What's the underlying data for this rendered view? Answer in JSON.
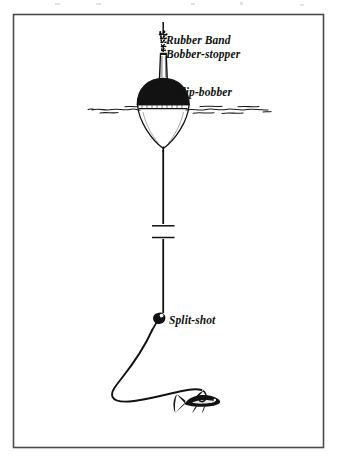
{
  "figure": {
    "medium": "pen-and-ink line illustration",
    "background_color": "#ffffff",
    "ink_color": "#121212",
    "frame": {
      "name": "illustration-border",
      "stroke_color": "#4a4a4a",
      "x": 13,
      "y": 14,
      "width": 310,
      "height": 433
    },
    "labels": [
      {
        "id": "rubber-band",
        "text": "Rubber Band",
        "x": 166,
        "y": 44,
        "font_size": 11.5,
        "style": "italic-bold-serif"
      },
      {
        "id": "bobber-stopper",
        "text": "Bobber-stopper",
        "x": 166,
        "y": 57.5,
        "font_size": 11.5,
        "style": "italic-bold-serif"
      },
      {
        "id": "slip-bobber",
        "text": "Slip-bobber",
        "x": 176,
        "y": 96,
        "font_size": 11.5,
        "style": "italic-bold-serif"
      },
      {
        "id": "split-shot",
        "text": "Split-shot",
        "x": 169,
        "y": 324,
        "font_size": 11.5,
        "style": "italic-bold-serif"
      }
    ],
    "components": [
      {
        "id": "fishing-line-upper",
        "name": "fishing-line",
        "description": "vertical monofilament line running from top of frame down through the rig"
      },
      {
        "id": "rubber-band-knot",
        "name": "rubber-band-knot",
        "description": "small knotted rubber band tied on the line as a depth stop"
      },
      {
        "id": "bobber-stopper-bead",
        "name": "bobber-stopper-bead",
        "description": "tapered stopper tube / bead threaded on the line below the rubber band"
      },
      {
        "id": "slip-bobber-float",
        "name": "slip-bobber-float",
        "description": "float with black domed top above waterline and white tapered body below"
      },
      {
        "id": "waterline",
        "name": "waterline",
        "description": "wavy horizontal water surface line crossing the float"
      },
      {
        "id": "line-break-mark",
        "name": "line-break-mark",
        "description": "two short horizontal tick marks indicating the line continues"
      },
      {
        "id": "split-shot-weight",
        "name": "split-shot-weight",
        "description": "small round lead split-shot weight pinched on the line"
      },
      {
        "id": "leader-loop",
        "name": "leader-line",
        "description": "slack leader curving down-left then sweeping right to the bait"
      },
      {
        "id": "minnow-bait",
        "name": "minnow-bait",
        "description": "hooked live minnow at the end of the leader"
      }
    ]
  }
}
